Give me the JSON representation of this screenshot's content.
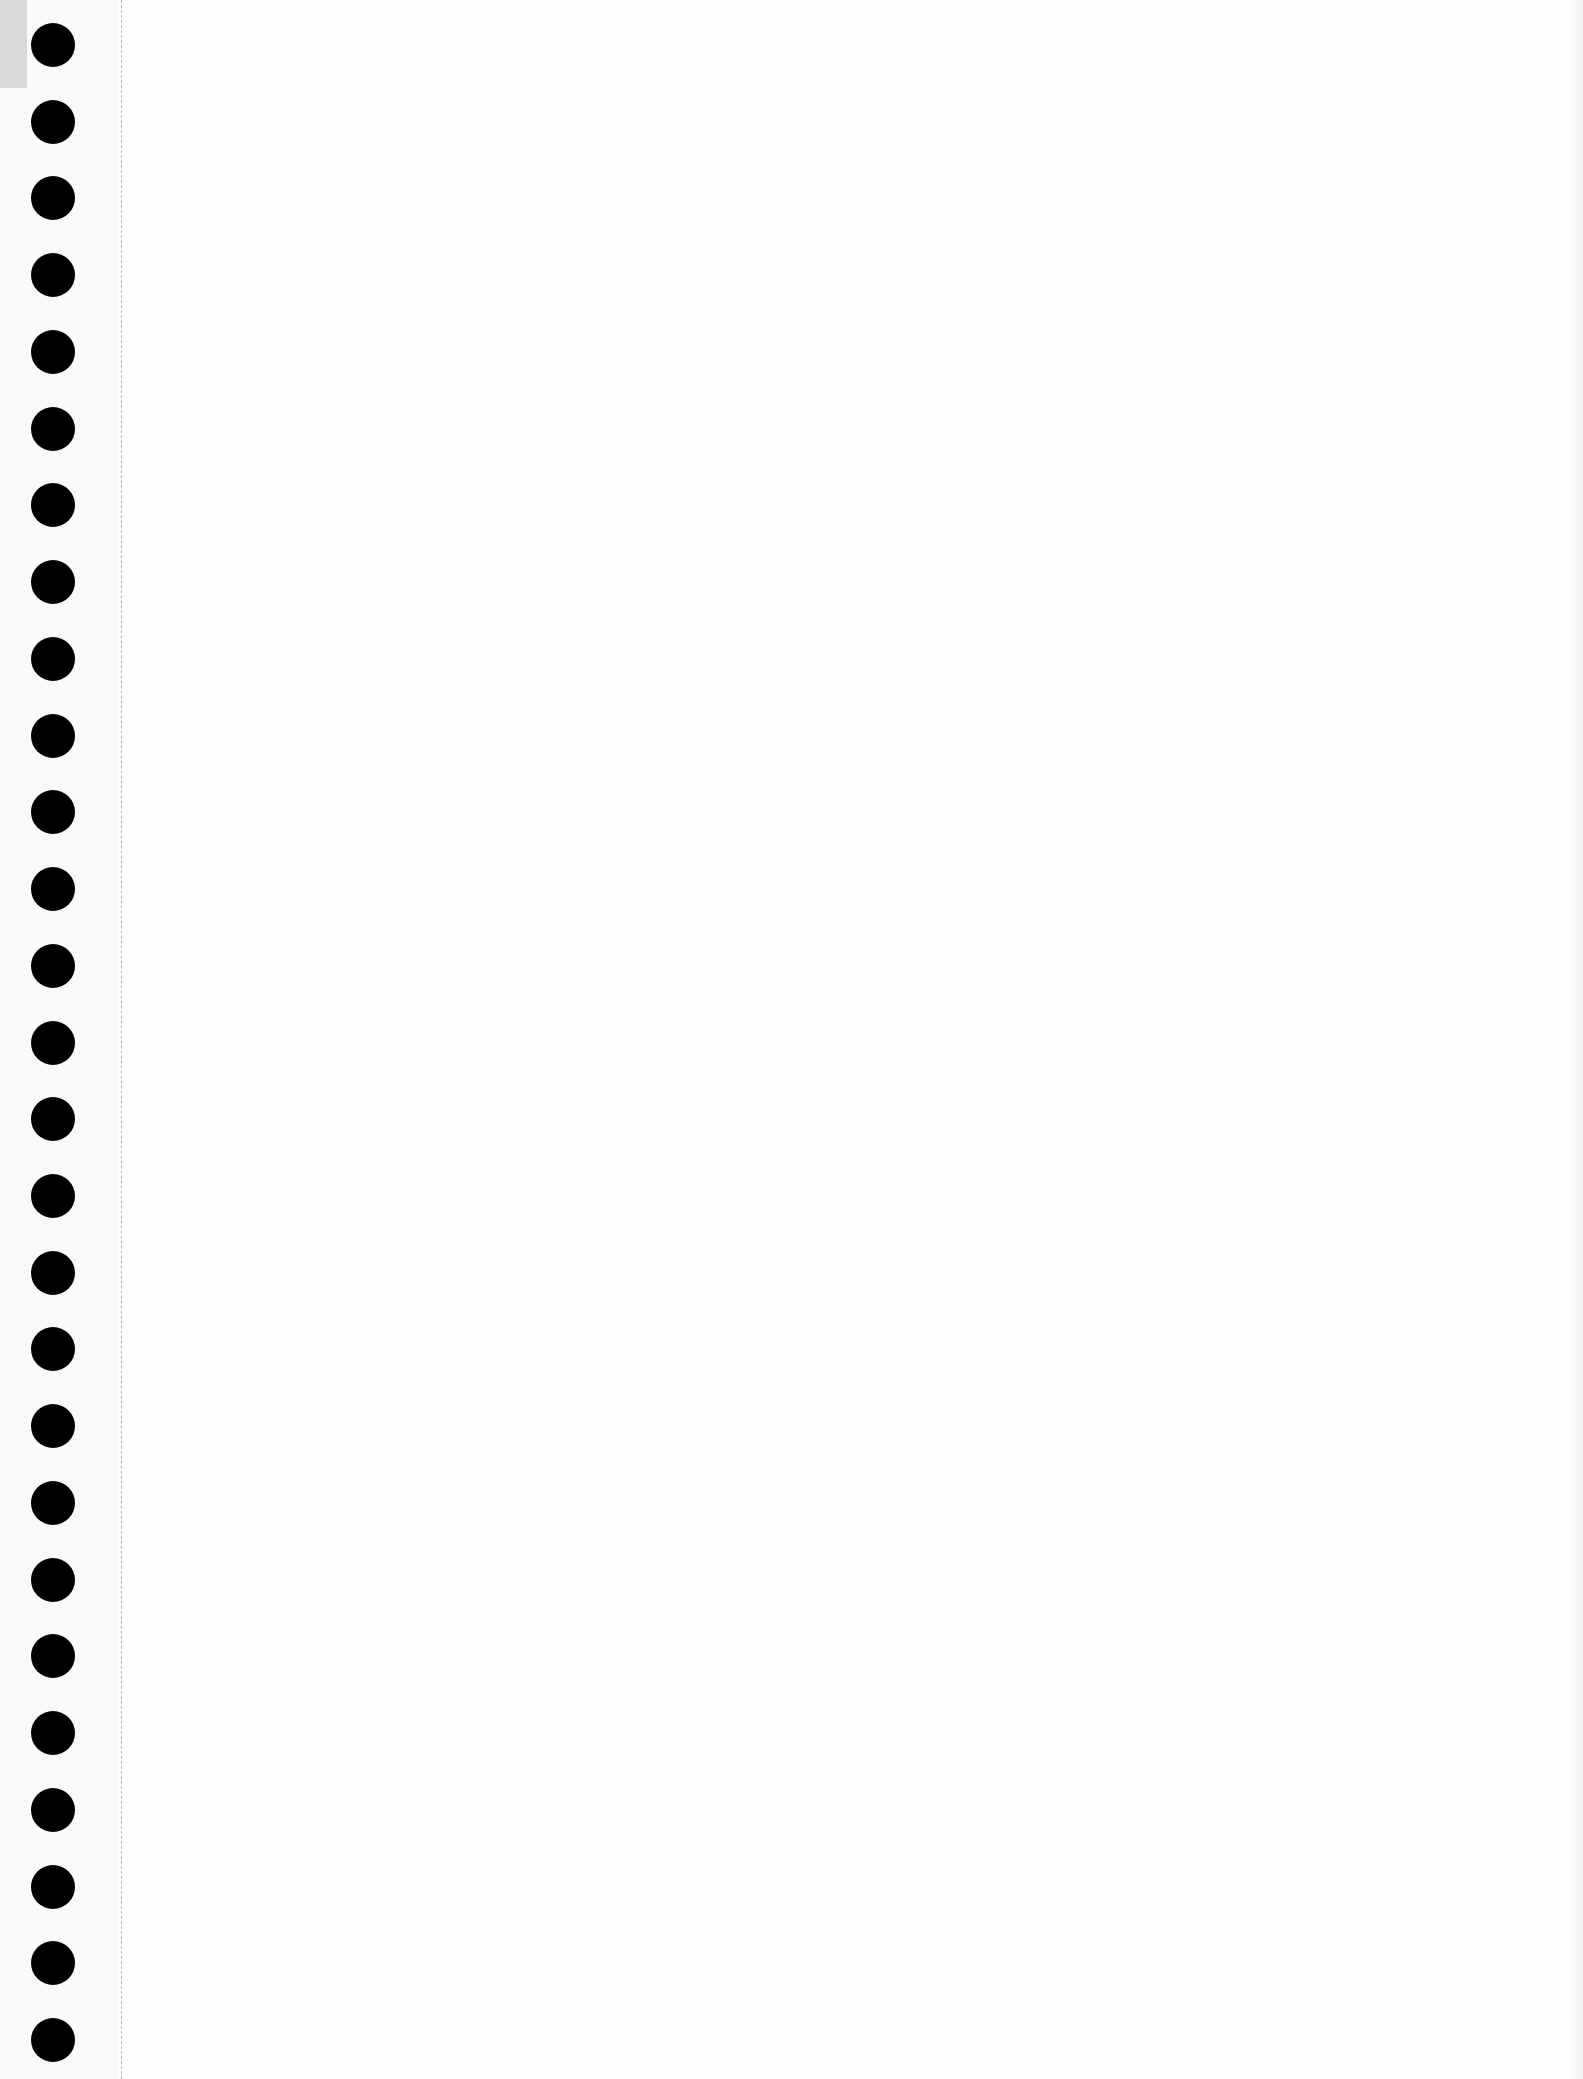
{
  "document": {
    "type": "blank notebook page",
    "content_text": "",
    "hole_count": 27,
    "colors": {
      "paper": "#fefefe",
      "hole": "#000000",
      "perforation": "#9a9a9a",
      "corner_tab": "#d9d9d9"
    }
  }
}
